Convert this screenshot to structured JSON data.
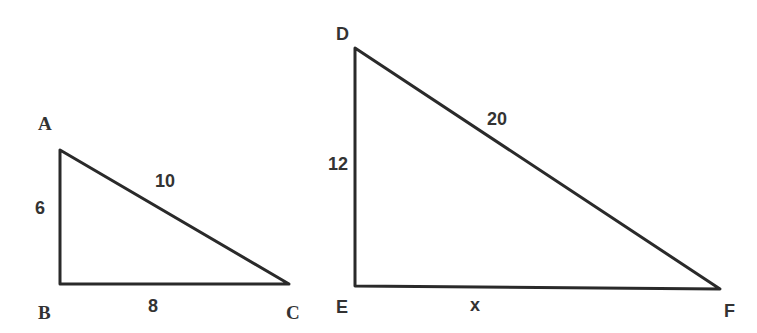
{
  "triangle_abc": {
    "vertices": {
      "A": "A",
      "B": "B",
      "C": "C"
    },
    "sides": {
      "AB": "6",
      "BC": "8",
      "AC": "10"
    }
  },
  "triangle_def": {
    "vertices": {
      "D": "D",
      "E": "E",
      "F": "F"
    },
    "sides": {
      "DE": "12",
      "EF": "x",
      "DF": "20"
    }
  },
  "colors": {
    "line": "#2a2a2a",
    "text": "#333333",
    "background": "#ffffff"
  }
}
